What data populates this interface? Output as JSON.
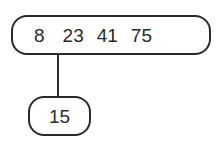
{
  "diagram": {
    "type": "b-tree",
    "root": {
      "keys": [
        "8",
        "23",
        "41",
        "75"
      ]
    },
    "children": [
      {
        "keys": [
          "15"
        ],
        "attached_between": [
          "8",
          "23"
        ]
      }
    ],
    "colors": {
      "stroke": "#2a2a2a",
      "background": "#ffffff"
    }
  }
}
